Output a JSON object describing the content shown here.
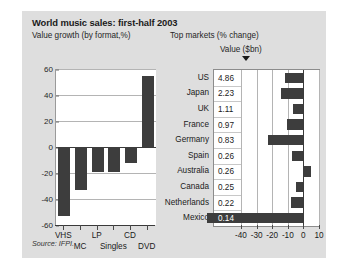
{
  "title": "World music sales: first-half 2003",
  "subtitle_left": "Value growth (by format,%)",
  "subtitle_right": "Top markets (% change)",
  "value_column_header": "Value ($bn)",
  "source": "Source: IFPI.",
  "colors": {
    "panel_background": "#dedede",
    "plot_background": "#ffffff",
    "bar": "#3d3d3d",
    "gridline": "#b4b4b4",
    "axis": "#3a3a3a",
    "text": "#1a1a1a"
  },
  "icons": {
    "sort-marker": "down-triangle-icon"
  },
  "chart_data": [
    {
      "type": "bar",
      "title": "Value growth (by format,%)",
      "xlabel": "",
      "ylabel": "",
      "ylim": [
        -60,
        60
      ],
      "yticks": [
        60,
        40,
        20,
        0,
        -20,
        -40,
        -60
      ],
      "ytick_labels": [
        "60",
        "40",
        "20",
        "0",
        "-20",
        "-40",
        "-60"
      ],
      "grid": true,
      "legend": "none",
      "categories": [
        "VHS",
        "MC",
        "LP",
        "Singles",
        "CD",
        "DVD"
      ],
      "values": [
        -53,
        -33,
        -19,
        -19,
        -12,
        55
      ]
    },
    {
      "type": "bar",
      "orientation": "horizontal",
      "title": "Top markets (% change)",
      "xlabel": "",
      "ylabel": "",
      "xlim": [
        -40,
        10
      ],
      "xticks": [
        -40,
        -30,
        -20,
        -10,
        0,
        10
      ],
      "xtick_labels": [
        "-40",
        "-30",
        "-20",
        "-10",
        "0",
        "10"
      ],
      "grid": true,
      "legend": "none",
      "value_series_label": "Value ($bn)",
      "categories": [
        "US",
        "Japan",
        "UK",
        "France",
        "Germany",
        "Spain",
        "Australia",
        "Canada",
        "Netherlands",
        "Mexico"
      ],
      "values": [
        -11.5,
        -14.5,
        -6.5,
        -10.5,
        -22.5,
        -7.0,
        5.0,
        -5.0,
        -8.0,
        -33.0
      ],
      "value_sbn": [
        "4.86",
        "2.23",
        "1.11",
        "0.97",
        "0.83",
        "0.26",
        "0.26",
        "0.25",
        "0.22",
        "0.14"
      ]
    }
  ]
}
